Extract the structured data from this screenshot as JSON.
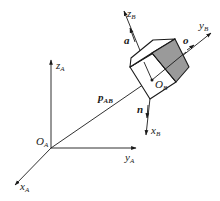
{
  "diagram": {
    "type": "coordinate-frame-transform",
    "frame_A": {
      "origin_label": "O",
      "origin_sub": "A",
      "axes": [
        {
          "name": "z",
          "sub": "A"
        },
        {
          "name": "y",
          "sub": "A"
        },
        {
          "name": "x",
          "sub": "A"
        }
      ]
    },
    "frame_B": {
      "origin_label": "O",
      "origin_sub": "B",
      "axes": [
        {
          "name": "z",
          "sub": "B"
        },
        {
          "name": "y",
          "sub": "B"
        },
        {
          "name": "x",
          "sub": "B"
        }
      ],
      "vectors": [
        {
          "name": "a",
          "along": "z_B"
        },
        {
          "name": "o",
          "along": "y_B"
        },
        {
          "name": "n",
          "along": "x_B"
        }
      ]
    },
    "position_vector": {
      "name": "p",
      "sub": "AB"
    },
    "colors": {
      "line": "#1a1a1a",
      "shaded_face": "#9a9a9a",
      "background": "#ffffff"
    }
  }
}
